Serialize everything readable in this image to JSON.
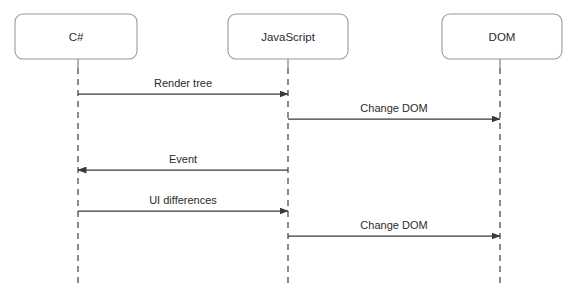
{
  "diagram": {
    "type": "sequence-diagram",
    "canvas": {
      "width": 579,
      "height": 298,
      "background": "#ffffff"
    },
    "colors": {
      "box_border": "#9a9a9a",
      "box_fill": "#ffffff",
      "text": "#2b2b2b",
      "lifeline": "#6e6e6e",
      "arrow": "#3a3a3a"
    },
    "participants": [
      {
        "id": "csharp",
        "label": "C#",
        "box_x": 15,
        "box_y": 14,
        "box_w": 122,
        "box_h": 45,
        "lifeline_x": 78
      },
      {
        "id": "javascript",
        "label": "JavaScript",
        "box_x": 228,
        "box_y": 14,
        "box_w": 120,
        "box_h": 45,
        "lifeline_x": 288
      },
      {
        "id": "dom",
        "label": "DOM",
        "box_x": 442,
        "box_y": 14,
        "box_w": 120,
        "box_h": 45,
        "lifeline_x": 500
      }
    ],
    "lifeline": {
      "top": 59,
      "bottom": 285,
      "stub_end": 68
    },
    "messages": [
      {
        "id": "m1",
        "label": "Render tree",
        "from": "csharp",
        "to": "javascript",
        "x1": 78,
        "x2": 288,
        "y": 94,
        "direction": "right"
      },
      {
        "id": "m2",
        "label": "Change DOM",
        "from": "javascript",
        "to": "dom",
        "x1": 288,
        "x2": 500,
        "y": 119,
        "direction": "right"
      },
      {
        "id": "m3",
        "label": "Event",
        "from": "javascript",
        "to": "csharp",
        "x1": 288,
        "x2": 78,
        "y": 170,
        "direction": "left"
      },
      {
        "id": "m4",
        "label": "UI differences",
        "from": "csharp",
        "to": "javascript",
        "x1": 78,
        "x2": 288,
        "y": 211,
        "direction": "right"
      },
      {
        "id": "m5",
        "label": "Change DOM",
        "from": "javascript",
        "to": "dom",
        "x1": 288,
        "x2": 500,
        "y": 236,
        "direction": "right"
      }
    ]
  }
}
